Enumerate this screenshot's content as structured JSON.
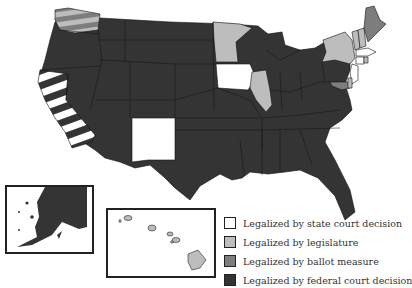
{
  "colors": {
    "state_court": "#ffffff",
    "legislature": "#bdbdbd",
    "ballot_measure": "#7d7d7d",
    "federal_court": "#343434",
    "border": "#111111"
  },
  "legend": {
    "items": [
      {
        "key": "state_court",
        "label": "Legalized by state court decision",
        "color": "#ffffff"
      },
      {
        "key": "legislature",
        "label": "Legalized by legislature",
        "color": "#bdbdbd"
      },
      {
        "key": "ballot_measure",
        "label": "Legalized by ballot measure",
        "color": "#7d7d7d"
      },
      {
        "key": "federal_court",
        "label": "Legalized by federal court decision",
        "color": "#343434"
      }
    ]
  },
  "states": {
    "state_court": [
      "California (striped with federal court)",
      "Iowa",
      "New Mexico",
      "Massachusetts",
      "Connecticut",
      "New Jersey"
    ],
    "legislature": [
      "Washington (striped with ballot measure)",
      "Minnesota",
      "Illinois",
      "New York",
      "Vermont",
      "New Hampshire",
      "Rhode Island",
      "Delaware",
      "Hawaii"
    ],
    "ballot_measure": [
      "Washington (striped with legislature)",
      "Maine",
      "Maryland"
    ],
    "federal_court": [
      "All other states",
      "Alaska",
      "California (striped with state court)"
    ]
  },
  "insets": [
    {
      "name": "Alaska",
      "category": "federal_court"
    },
    {
      "name": "Hawaii",
      "category": "legislature"
    }
  ]
}
